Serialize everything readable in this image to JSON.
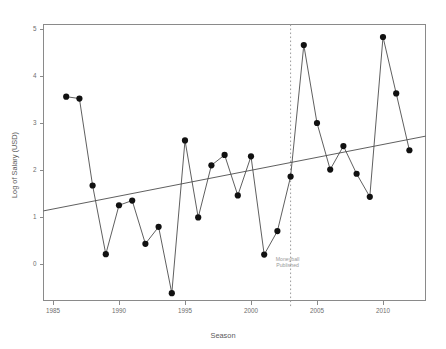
{
  "chart_data": {
    "type": "scatter",
    "title": "",
    "xlabel": "Season",
    "ylabel": "Log of Salary (USD)",
    "xlim": [
      1984.2,
      1984.2
    ],
    "ylim": [
      -0.85,
      5.2
    ],
    "xticks": [
      1985,
      1990,
      1995,
      2000,
      2005,
      2010
    ],
    "yticks": [
      0,
      1,
      2,
      3,
      4,
      5
    ],
    "xticklabels": [
      "1985",
      "1990",
      "1995",
      "2000",
      "2005",
      "2010"
    ],
    "yticklabels": [
      "0",
      "1",
      "2",
      "3",
      "4",
      "5"
    ],
    "grid": false,
    "legend": "none",
    "series": [
      {
        "name": "Log of Salary (USD)",
        "marker": "filled-circle",
        "x": [
          1986,
          1987,
          1988,
          1989,
          1990,
          1991,
          1992,
          1993,
          1994,
          1995,
          1996,
          1997,
          1998,
          1999,
          2000,
          2001,
          2002,
          2003,
          2004,
          2005,
          2006,
          2007,
          2008,
          2009,
          2010,
          2011,
          2012
        ],
        "values": [
          3.56,
          3.52,
          1.67,
          0.21,
          1.25,
          1.35,
          0.43,
          0.79,
          -0.62,
          2.63,
          0.99,
          2.1,
          2.32,
          1.46,
          2.29,
          0.2,
          0.7,
          1.86,
          4.66,
          3.0,
          2.01,
          2.51,
          1.92,
          1.43,
          4.83,
          3.63,
          2.42
        ]
      }
    ],
    "trendline": {
      "name": "linear-fit",
      "x_start": 1984.2,
      "y_start": 1.13,
      "x_end": 2012.9,
      "y_end": 2.72
    },
    "annotations": [
      {
        "name": "moneyball-event",
        "x": 2003,
        "type": "vertical-dashed-line",
        "label_line1": "Moneyball",
        "label_line2": "Published",
        "label_y": 0.06,
        "color": "#9a9a9a"
      }
    ],
    "colors": {
      "point": "#111111",
      "line": "#4d4d4d",
      "trend": "#4d4d4d",
      "axis": "#8a8a8a",
      "text": "#6d6d6d",
      "annotation": "#9a9a9a",
      "background": "#ffffff"
    }
  }
}
